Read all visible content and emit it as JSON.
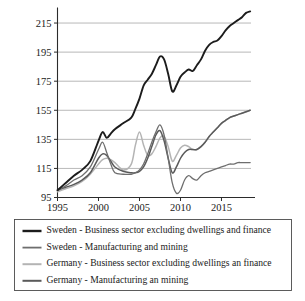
{
  "chart_data": {
    "type": "line",
    "title": "",
    "subtitle": "",
    "xlabel": "",
    "ylabel": "",
    "xlim": [
      1995,
      2018.6
    ],
    "ylim": [
      95,
      225
    ],
    "xticks": [
      1995,
      2000,
      2005,
      2010,
      2015
    ],
    "yticks": [
      95,
      115,
      135,
      155,
      175,
      195,
      215
    ],
    "xtick_labels": [
      "1995",
      "2000",
      "2005",
      "2010",
      "2015"
    ],
    "ytick_labels": [
      "95",
      "115",
      "135",
      "155",
      "175",
      "195",
      "215"
    ],
    "grid": "horizontal",
    "legend_position": "below",
    "x": [
      1995,
      1996,
      1997,
      1998,
      1999,
      2000,
      2000.5,
      2001,
      2001.5,
      2002,
      2003,
      2004,
      2004.5,
      2005,
      2005.5,
      2006,
      2006.5,
      2007,
      2007.5,
      2008,
      2008.5,
      2009,
      2009.5,
      2010,
      2010.5,
      2011,
      2011.5,
      2012,
      2012.5,
      2013,
      2013.5,
      2014,
      2014.5,
      2015,
      2015.5,
      2016,
      2016.5,
      2017,
      2017.5,
      2018,
      2018.5
    ],
    "series": [
      {
        "name": "Sweden - Business sector excluding dwellings and finance",
        "color": "#1c1c1c",
        "width": 1.9,
        "values": [
          100,
          105,
          110,
          114,
          120,
          134,
          140,
          136,
          139,
          142,
          146,
          150,
          156,
          163,
          172,
          176,
          180,
          186,
          192,
          190,
          180,
          168,
          172,
          178,
          181,
          183,
          182,
          186,
          190,
          196,
          200,
          202,
          203,
          206,
          210,
          213,
          215,
          217,
          219,
          222,
          223
        ]
      },
      {
        "name": "Sweden - Manufacturing and mining",
        "color": "#6e6e6e",
        "width": 1.3,
        "values": [
          100,
          103,
          107,
          110,
          116,
          128,
          133,
          126,
          118,
          112,
          111,
          111,
          112,
          114,
          118,
          125,
          133,
          140,
          145,
          138,
          122,
          105,
          98,
          100,
          107,
          110,
          108,
          107,
          110,
          112,
          113,
          114,
          115,
          116,
          117,
          118,
          118,
          119,
          119,
          119,
          119
        ]
      },
      {
        "name": "Germany - Business sector excluding dwellings an finance",
        "color": "#b4b4b4",
        "width": 1.5,
        "values": [
          99,
          101,
          103,
          106,
          111,
          118,
          121,
          122,
          121,
          119,
          114,
          118,
          131,
          140,
          131,
          124,
          125,
          130,
          136,
          137,
          130,
          120,
          124,
          129,
          131,
          130,
          128,
          128,
          130,
          133,
          137,
          140,
          143,
          146,
          148,
          150,
          151,
          152,
          153,
          154,
          155
        ]
      },
      {
        "name": "Germany - Manufacturing an mining",
        "color": "#5a5a5a",
        "width": 1.5,
        "values": [
          100,
          102,
          104,
          107,
          112,
          122,
          125,
          124,
          120,
          116,
          113,
          112,
          112,
          113,
          116,
          122,
          130,
          138,
          141,
          134,
          122,
          112,
          116,
          122,
          126,
          128,
          128,
          128,
          130,
          133,
          137,
          140,
          143,
          146,
          148,
          150,
          151,
          152,
          153,
          154,
          155
        ]
      }
    ],
    "legend_entries": [
      "Sweden - Business sector excluding dwellings and finance",
      "Sweden - Manufacturing and mining",
      "Germany - Business sector excluding dwellings an finance",
      "Germany - Manufacturing an mining"
    ]
  }
}
